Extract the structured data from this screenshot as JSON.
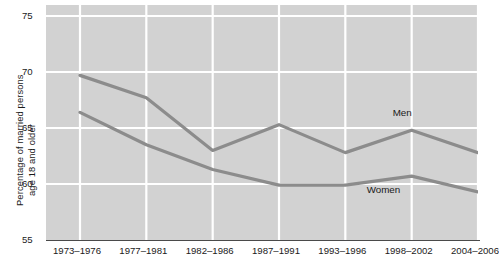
{
  "chart_data": {
    "type": "line",
    "title": "",
    "xlabel": "",
    "ylabel_line1": "Percentage of married persons",
    "ylabel_line2": "age 18 and older",
    "categories": [
      "1973–1976",
      "1977–1981",
      "1982–1986",
      "1987–1991",
      "1993–1996",
      "1998–2002",
      "2004–2006"
    ],
    "yticks": [
      "55",
      "60",
      "65",
      "70",
      "75"
    ],
    "ylim": [
      55,
      75
    ],
    "grid": true,
    "legend_position": "inline-annotation",
    "series": [
      {
        "name": "Men",
        "color": "#8c8c8c",
        "values": [
          69.7,
          67.7,
          63.0,
          65.3,
          62.8,
          64.8,
          62.8
        ],
        "annotation": "Men"
      },
      {
        "name": "Women",
        "color": "#8c8c8c",
        "values": [
          66.4,
          63.5,
          61.3,
          59.9,
          59.9,
          60.7,
          59.3
        ],
        "annotation": "Women"
      }
    ],
    "plot_background": "#d2d2d2",
    "gridline_color": "#ffffff",
    "axis_color": "#4a4a4a"
  }
}
